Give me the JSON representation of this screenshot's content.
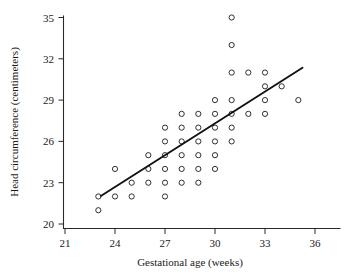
{
  "chart_data": {
    "type": "scatter",
    "title": "",
    "xlabel": "Gestational age (weeks)",
    "ylabel": "Head circumference (centimeters)",
    "xlim": [
      20.6,
      36.8
    ],
    "ylim": [
      19.6,
      35.4
    ],
    "xticks": [
      21,
      24,
      27,
      30,
      33,
      36
    ],
    "yticks": [
      20,
      23,
      26,
      29,
      32,
      35
    ],
    "xtick_labels": [
      "21",
      "24",
      "27",
      "30",
      "33",
      "36"
    ],
    "ytick_labels": [
      "20",
      "23",
      "26",
      "29",
      "32",
      "35"
    ],
    "grid": false,
    "legend": false,
    "marker": "open-circle",
    "points": [
      {
        "x": 23.0,
        "y": 21.0
      },
      {
        "x": 23.0,
        "y": 22.0
      },
      {
        "x": 24.0,
        "y": 22.0
      },
      {
        "x": 24.0,
        "y": 24.0
      },
      {
        "x": 25.0,
        "y": 22.0
      },
      {
        "x": 25.0,
        "y": 23.0
      },
      {
        "x": 26.0,
        "y": 23.0
      },
      {
        "x": 26.0,
        "y": 24.0
      },
      {
        "x": 26.0,
        "y": 25.0
      },
      {
        "x": 27.0,
        "y": 22.0
      },
      {
        "x": 27.0,
        "y": 23.0
      },
      {
        "x": 27.0,
        "y": 24.0
      },
      {
        "x": 27.0,
        "y": 25.0
      },
      {
        "x": 27.0,
        "y": 26.0
      },
      {
        "x": 27.0,
        "y": 27.0
      },
      {
        "x": 28.0,
        "y": 23.0
      },
      {
        "x": 28.0,
        "y": 24.0
      },
      {
        "x": 28.0,
        "y": 25.0
      },
      {
        "x": 28.0,
        "y": 26.0
      },
      {
        "x": 28.0,
        "y": 27.0
      },
      {
        "x": 28.0,
        "y": 28.0
      },
      {
        "x": 29.0,
        "y": 23.0
      },
      {
        "x": 29.0,
        "y": 24.0
      },
      {
        "x": 29.0,
        "y": 25.0
      },
      {
        "x": 29.0,
        "y": 26.0
      },
      {
        "x": 29.0,
        "y": 27.0
      },
      {
        "x": 29.0,
        "y": 28.0
      },
      {
        "x": 30.0,
        "y": 24.0
      },
      {
        "x": 30.0,
        "y": 25.0
      },
      {
        "x": 30.0,
        "y": 26.0
      },
      {
        "x": 30.0,
        "y": 27.0
      },
      {
        "x": 30.0,
        "y": 28.0
      },
      {
        "x": 30.0,
        "y": 29.0
      },
      {
        "x": 31.0,
        "y": 26.0
      },
      {
        "x": 31.0,
        "y": 27.0
      },
      {
        "x": 31.0,
        "y": 28.0
      },
      {
        "x": 31.0,
        "y": 29.0
      },
      {
        "x": 31.0,
        "y": 31.0
      },
      {
        "x": 31.0,
        "y": 33.0
      },
      {
        "x": 31.0,
        "y": 35.0
      },
      {
        "x": 32.0,
        "y": 28.0
      },
      {
        "x": 32.0,
        "y": 31.0
      },
      {
        "x": 33.0,
        "y": 28.0
      },
      {
        "x": 33.0,
        "y": 29.0
      },
      {
        "x": 33.0,
        "y": 30.0
      },
      {
        "x": 33.0,
        "y": 31.0
      },
      {
        "x": 34.0,
        "y": 30.0
      },
      {
        "x": 35.0,
        "y": 29.0
      }
    ],
    "fit_line": {
      "x_start": 23.15,
      "y_start": 22.03,
      "x_end": 35.25,
      "y_end": 31.35,
      "style": "solid"
    }
  }
}
